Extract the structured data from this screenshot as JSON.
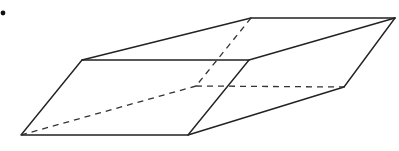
{
  "figure": {
    "type": "oblique-prism-wireframe",
    "bullet": {
      "x": 3,
      "y": 13,
      "r": 2.4
    },
    "vertices": {
      "front_bottom_left": [
        21,
        135
      ],
      "front_bottom_right": [
        188,
        135
      ],
      "front_top_left": [
        82,
        60
      ],
      "front_top_right": [
        249,
        60
      ],
      "back_top_left": [
        251,
        18
      ],
      "back_top_right": [
        395,
        18
      ],
      "back_bottom_right": [
        344,
        87
      ],
      "back_bottom_left_hidden": [
        196,
        86
      ]
    },
    "colors": {
      "line": "#222222",
      "background": "#ffffff"
    }
  }
}
